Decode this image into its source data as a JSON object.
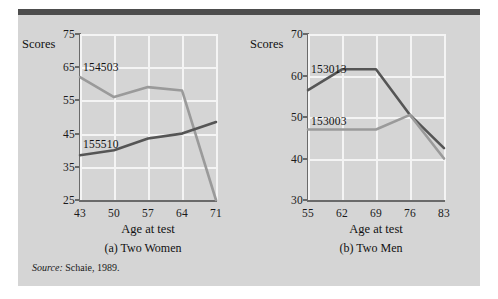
{
  "figure": {
    "source_note_label": "Source:",
    "source_note_text": "Schaie, 1989."
  },
  "colors": {
    "panel_background": "#d5d5d5",
    "top_rule": "#4d4d4d",
    "axis": "#6a6a6a",
    "gridline": "#f4f4f4",
    "series_dark": "#555555",
    "series_light": "#9a9a9a",
    "text": "#111111"
  },
  "charts": [
    {
      "key": "two_women",
      "caption": "(a) Two Women",
      "ylabel": "Scores",
      "xlabel": "Age at test",
      "yticks": [
        25,
        35,
        45,
        55,
        65,
        75
      ],
      "xticks": [
        43,
        50,
        57,
        64,
        71
      ],
      "ylim": [
        25,
        75
      ],
      "series": [
        {
          "name": "154503",
          "color_key": "series_light",
          "label_x_value": 43,
          "label_y_value": 65,
          "values": [
            62.0,
            56.0,
            59.0,
            58.0,
            25.0
          ]
        },
        {
          "name": "155510",
          "color_key": "series_dark",
          "label_x_value": 43,
          "label_y_value": 42.0,
          "values": [
            38.5,
            40.0,
            43.5,
            45.0,
            48.5
          ]
        }
      ]
    },
    {
      "key": "two_men",
      "caption": "(b) Two Men",
      "ylabel": "Scores",
      "xlabel": "Age at test",
      "yticks": [
        30,
        40,
        50,
        60,
        70
      ],
      "xticks": [
        55,
        62,
        69,
        76,
        83
      ],
      "ylim": [
        30,
        70
      ],
      "series": [
        {
          "name": "153013",
          "color_key": "series_dark",
          "label_x_value": 55,
          "label_y_value": 61.5,
          "values": [
            56.5,
            61.5,
            61.5,
            50.5,
            42.5
          ]
        },
        {
          "name": "153003",
          "color_key": "series_light",
          "label_x_value": 55,
          "label_y_value": 49.0,
          "values": [
            47.0,
            47.0,
            47.0,
            50.5,
            40.0
          ]
        }
      ]
    }
  ],
  "chart_data": [
    {
      "type": "line",
      "title": "(a) Two Women",
      "xlabel": "Age at test",
      "ylabel": "Scores",
      "x": [
        43,
        50,
        57,
        64,
        71
      ],
      "xlim": [
        43,
        71
      ],
      "ylim": [
        25,
        75
      ],
      "yticks": [
        25,
        35,
        45,
        55,
        65,
        75
      ],
      "grid": true,
      "legend": "inline-labels",
      "series": [
        {
          "name": "154503",
          "values": [
            62.0,
            56.0,
            59.0,
            58.0,
            25.0
          ]
        },
        {
          "name": "155510",
          "values": [
            38.5,
            40.0,
            43.5,
            45.0,
            48.5
          ]
        }
      ]
    },
    {
      "type": "line",
      "title": "(b) Two Men",
      "xlabel": "Age at test",
      "ylabel": "Scores",
      "x": [
        55,
        62,
        69,
        76,
        83
      ],
      "xlim": [
        55,
        83
      ],
      "ylim": [
        30,
        70
      ],
      "yticks": [
        30,
        40,
        50,
        60,
        70
      ],
      "grid": true,
      "legend": "inline-labels",
      "series": [
        {
          "name": "153013",
          "values": [
            56.5,
            61.5,
            61.5,
            50.5,
            42.5
          ]
        },
        {
          "name": "153003",
          "values": [
            47.0,
            47.0,
            47.0,
            50.5,
            40.0
          ]
        }
      ]
    }
  ]
}
